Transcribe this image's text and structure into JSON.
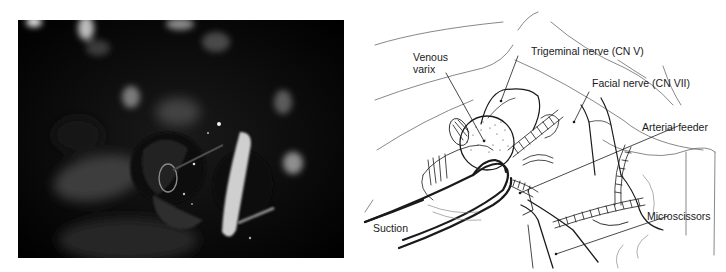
{
  "figure": {
    "left_panel": {
      "type": "intraoperative-photograph",
      "tone": "grayscale"
    },
    "right_panel": {
      "type": "anatomical-illustration",
      "labels": {
        "venous_varix_line1": "Venous",
        "venous_varix_line2": "varix",
        "trigeminal_nerve": "Trigeminal nerve (CN V)",
        "facial_nerve": "Facial nerve (CN VII)",
        "arterial_feeder": "Arterial feeder",
        "microscissors": "Microscissors",
        "suction": "Suction"
      }
    }
  },
  "colors": {
    "photo_bg": "#050505",
    "line": "#1a1a1a",
    "background": "#ffffff"
  }
}
